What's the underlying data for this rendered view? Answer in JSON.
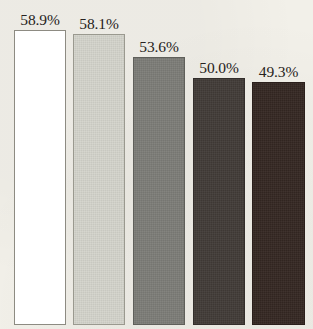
{
  "chart_data": {
    "type": "bar",
    "title": "",
    "subtitle": "",
    "xlabel": "",
    "ylabel": "",
    "grid": false,
    "legend": "none",
    "axis_visible": false,
    "value_label_position": "above-bar",
    "value_suffix": "%",
    "ylim": [
      0,
      62
    ],
    "categories": [
      "",
      "",
      "",
      "",
      ""
    ],
    "values": [
      58.9,
      58.1,
      53.6,
      50.0,
      49.3
    ],
    "labels": [
      "58.9%",
      "58.1%",
      "53.6%",
      "50.0%",
      "49.3%"
    ],
    "bars": [
      {
        "label": "58.9%",
        "value": 58.9,
        "fill": "#ffffff",
        "border": "#8d8b82",
        "textured": false,
        "left_px": 14,
        "width_px": 52,
        "top_px": 30
      },
      {
        "label": "58.1%",
        "value": 58.1,
        "fill": "#d4d4cc",
        "border": "#9a998f",
        "textured": true,
        "left_px": 73,
        "width_px": 52,
        "top_px": 34
      },
      {
        "label": "53.6%",
        "value": 53.6,
        "fill": "#7d7d78",
        "border": "#5f5f5a",
        "textured": true,
        "left_px": 133,
        "width_px": 52,
        "top_px": 57
      },
      {
        "label": "50.0%",
        "value": 50.0,
        "fill": "#423c38",
        "border": "#332e2b",
        "textured": true,
        "left_px": 193,
        "width_px": 52,
        "top_px": 78
      },
      {
        "label": "49.3%",
        "value": 49.3,
        "fill": "#352823",
        "border": "#2a1f1b",
        "textured": true,
        "left_px": 252,
        "width_px": 53,
        "top_px": 82
      }
    ],
    "colors": {
      "background": "#f2f0e9",
      "label_text": "#262220"
    }
  }
}
